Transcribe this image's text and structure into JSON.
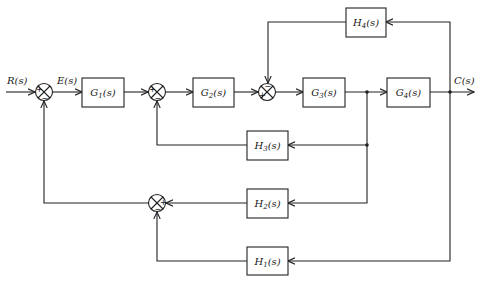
{
  "diagram": {
    "type": "control-system-block-diagram",
    "signals": {
      "input": "R(s)",
      "error": "E(s)",
      "output": "C(s)"
    },
    "blocks": {
      "G1": {
        "name": "G",
        "sub": "1",
        "label": "G1(s)"
      },
      "G2": {
        "name": "G",
        "sub": "2",
        "label": "G2(s)"
      },
      "G3": {
        "name": "G",
        "sub": "3",
        "label": "G3(s)"
      },
      "G4": {
        "name": "G",
        "sub": "4",
        "label": "G4(s)"
      },
      "H1": {
        "name": "H",
        "sub": "1",
        "label": "H1(s)"
      },
      "H2": {
        "name": "H",
        "sub": "2",
        "label": "H2(s)"
      },
      "H3": {
        "name": "H",
        "sub": "3",
        "label": "H3(s)"
      },
      "H4": {
        "name": "H",
        "sub": "4",
        "label": "H4(s)"
      }
    },
    "summing_junctions": {
      "S1": {
        "inputs": [
          "R(s) +",
          "feedback from S4 -"
        ]
      },
      "S2": {
        "inputs": [
          "G1 output +",
          "H3 feedback -"
        ]
      },
      "S3": {
        "inputs": [
          "G2 output +",
          "H4 feedback -"
        ]
      },
      "S4": {
        "inputs": [
          "H2 output +",
          "H1 output -"
        ]
      }
    },
    "signs": {
      "plus": "+",
      "minus": "−"
    }
  }
}
